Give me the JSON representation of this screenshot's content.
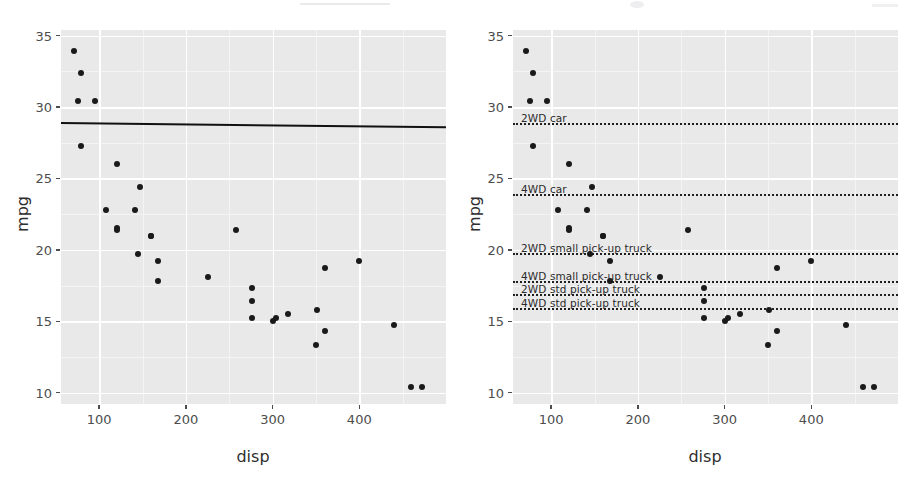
{
  "figure": {
    "background_color": "#ffffff",
    "panel_background_color": "#e9e9e9",
    "gridline_color": "#ffffff",
    "point_color": "#1a1a1a",
    "line_color": "#111111"
  },
  "chart_data": [
    {
      "type": "scatter",
      "panel": "left",
      "title": "",
      "xlabel": "disp",
      "ylabel": "mpg",
      "xlim": [
        56,
        500
      ],
      "ylim": [
        9.2,
        35.4
      ],
      "xticks": [
        100,
        200,
        300,
        400
      ],
      "yticks": [
        10,
        15,
        20,
        25,
        30,
        35
      ],
      "xticklabels": [
        "100",
        "200",
        "300",
        "400"
      ],
      "yticklabels": [
        "10",
        "15",
        "20",
        "25",
        "30",
        "35"
      ],
      "grid": true,
      "legend": "none",
      "x": [
        160,
        160,
        108,
        258,
        360,
        225,
        360,
        146.7,
        140.8,
        167.6,
        167.6,
        275.8,
        275.8,
        275.8,
        472,
        460,
        440,
        78.7,
        75.7,
        71.1,
        120.1,
        318,
        304,
        350,
        400,
        79,
        120.3,
        95.1,
        351,
        145,
        301,
        121
      ],
      "y": [
        21,
        21,
        22.8,
        21.4,
        18.7,
        18.1,
        14.3,
        24.4,
        22.8,
        19.2,
        17.8,
        16.4,
        17.3,
        15.2,
        10.4,
        10.4,
        14.7,
        32.4,
        30.4,
        33.9,
        21.5,
        15.5,
        15.2,
        13.3,
        19.2,
        27.3,
        26,
        30.4,
        15.8,
        19.7,
        15,
        21.4
      ],
      "fit_line": {
        "label": "overall mean / fitted line",
        "style": "solid",
        "x_start": 56,
        "y_start": 28.95,
        "x_end": 500,
        "y_end": 28.65
      }
    },
    {
      "type": "scatter",
      "panel": "right",
      "title": "",
      "xlabel": "disp",
      "ylabel": "mpg",
      "xlim": [
        56,
        500
      ],
      "ylim": [
        9.2,
        35.4
      ],
      "xticks": [
        100,
        200,
        300,
        400
      ],
      "yticks": [
        10,
        15,
        20,
        25,
        30,
        35
      ],
      "xticklabels": [
        "100",
        "200",
        "300",
        "400"
      ],
      "yticklabels": [
        "10",
        "15",
        "20",
        "25",
        "30",
        "35"
      ],
      "grid": true,
      "legend": "inline-annotations",
      "x": [
        160,
        160,
        108,
        258,
        360,
        225,
        360,
        146.7,
        140.8,
        167.6,
        167.6,
        275.8,
        275.8,
        275.8,
        472,
        460,
        440,
        78.7,
        75.7,
        71.1,
        120.1,
        318,
        304,
        350,
        400,
        79,
        120.3,
        95.1,
        351,
        145,
        301,
        121
      ],
      "y": [
        21,
        21,
        22.8,
        21.4,
        18.7,
        18.1,
        14.3,
        24.4,
        22.8,
        19.2,
        17.8,
        16.4,
        17.3,
        15.2,
        10.4,
        10.4,
        14.7,
        32.4,
        30.4,
        33.9,
        21.5,
        15.5,
        15.2,
        13.3,
        19.2,
        27.3,
        26,
        30.4,
        15.8,
        19.7,
        15,
        21.4
      ],
      "reference_lines": [
        {
          "label": "2WD car",
          "value": 28.9,
          "style": "dotted"
        },
        {
          "label": "4WD car",
          "value": 23.9,
          "style": "dotted"
        },
        {
          "label": "2WD small pick-up truck",
          "value": 19.8,
          "style": "dotted"
        },
        {
          "label": "4WD small pick-up truck",
          "value": 17.8,
          "style": "dotted"
        },
        {
          "label": "2WD std pick-up truck",
          "value": 16.9,
          "style": "dotted"
        },
        {
          "label": "4WD std pick-up truck",
          "value": 15.9,
          "style": "dotted"
        }
      ]
    }
  ]
}
